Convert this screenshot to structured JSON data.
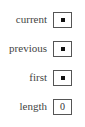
{
  "variables": [
    {
      "label": "current",
      "value": null,
      "value_kind": "pointer"
    },
    {
      "label": "previous",
      "value": null,
      "value_kind": "pointer"
    },
    {
      "label": "first",
      "value": null,
      "value_kind": "pointer"
    },
    {
      "label": "length",
      "value": "0",
      "value_kind": "number"
    }
  ],
  "colors": {
    "label": "#444444",
    "border": "#555555",
    "pointer_dot": "#111111"
  }
}
